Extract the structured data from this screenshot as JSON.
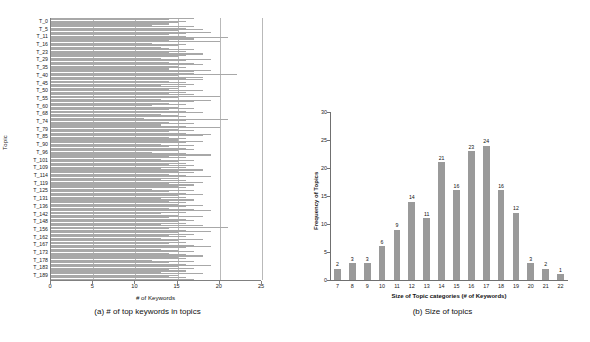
{
  "figure": {
    "panels": [
      {
        "id": "a",
        "caption": "(a) # of top keywords in topics",
        "xlabel": "# of Keywords",
        "ylabel": "Topic"
      },
      {
        "id": "b",
        "caption": "(b) Size of topics",
        "xlabel": "Size of Topic categories (# of Keywords)",
        "ylabel": "Frequency of Topics"
      }
    ],
    "colors": {
      "bar_a": "#a8a8a8",
      "bar_b": "#9a9a9a",
      "grid": "#b9b9b9",
      "axis": "#707070",
      "background": "#ffffff"
    }
  },
  "chart_data": [
    {
      "type": "bar",
      "orientation": "horizontal",
      "title": "(a) # of top keywords in topics",
      "xlabel": "# of Keywords",
      "ylabel": "Topic",
      "xlim": [
        0,
        25
      ],
      "xticks": [
        0,
        5,
        10,
        15,
        20,
        25
      ],
      "ytick_labels": [
        "T_0",
        "T_5",
        "T_11",
        "T_16",
        "T_23",
        "T_29",
        "T_35",
        "T_40",
        "T_45",
        "T_50",
        "T_55",
        "T_60",
        "T_68",
        "T_74",
        "T_79",
        "T_85",
        "T_90",
        "T_96",
        "T_101",
        "T_109",
        "T_114",
        "T_119",
        "T_125",
        "T_131",
        "T_136",
        "T_142",
        "T_148",
        "T_156",
        "T_162",
        "T_167",
        "T_173",
        "T_178",
        "T_183",
        "T_189"
      ],
      "grid": true,
      "legend": "none",
      "categories": [
        "T_0",
        "T_1",
        "T_2",
        "T_3",
        "T_4",
        "T_5",
        "T_6",
        "T_7",
        "T_8",
        "T_9",
        "T_10",
        "T_11",
        "T_12",
        "T_13",
        "T_14",
        "T_15",
        "T_16",
        "T_17",
        "T_18",
        "T_19",
        "T_20",
        "T_21",
        "T_22",
        "T_23",
        "T_24",
        "T_25",
        "T_26",
        "T_27",
        "T_28",
        "T_29",
        "T_30",
        "T_31",
        "T_32",
        "T_33",
        "T_34",
        "T_35",
        "T_36",
        "T_37",
        "T_38",
        "T_39",
        "T_40",
        "T_41",
        "T_42",
        "T_43",
        "T_44",
        "T_45",
        "T_46",
        "T_47",
        "T_48",
        "T_49",
        "T_50",
        "T_51",
        "T_52",
        "T_53",
        "T_54",
        "T_55",
        "T_56",
        "T_57",
        "T_58",
        "T_59",
        "T_60",
        "T_61",
        "T_62",
        "T_63",
        "T_64",
        "T_65",
        "T_66",
        "T_67",
        "T_68",
        "T_69",
        "T_70",
        "T_71",
        "T_72",
        "T_73",
        "T_74",
        "T_75",
        "T_76",
        "T_77",
        "T_78",
        "T_79",
        "T_80",
        "T_81",
        "T_82",
        "T_83",
        "T_84",
        "T_85",
        "T_86",
        "T_87",
        "T_88",
        "T_89",
        "T_90",
        "T_91",
        "T_92",
        "T_93",
        "T_94",
        "T_95",
        "T_96",
        "T_97",
        "T_98",
        "T_99",
        "T_100",
        "T_101",
        "T_102",
        "T_103",
        "T_104",
        "T_105",
        "T_106",
        "T_107",
        "T_108",
        "T_109",
        "T_110",
        "T_111",
        "T_112",
        "T_113",
        "T_114",
        "T_115",
        "T_116",
        "T_117",
        "T_118",
        "T_119",
        "T_120",
        "T_121",
        "T_122",
        "T_123",
        "T_124",
        "T_125",
        "T_126",
        "T_127",
        "T_128",
        "T_129",
        "T_130",
        "T_131",
        "T_132",
        "T_133",
        "T_134",
        "T_135",
        "T_136",
        "T_137",
        "T_138",
        "T_139",
        "T_140",
        "T_141",
        "T_142",
        "T_143",
        "T_144",
        "T_145",
        "T_146",
        "T_147",
        "T_148",
        "T_149",
        "T_150",
        "T_151",
        "T_152",
        "T_153",
        "T_154",
        "T_155",
        "T_156",
        "T_157",
        "T_158",
        "T_159",
        "T_160",
        "T_161",
        "T_162",
        "T_163",
        "T_164",
        "T_165",
        "T_166",
        "T_167",
        "T_168",
        "T_169",
        "T_170",
        "T_171",
        "T_172",
        "T_173",
        "T_174",
        "T_175",
        "T_176",
        "T_177",
        "T_178",
        "T_179",
        "T_180",
        "T_181",
        "T_182",
        "T_183",
        "T_184",
        "T_185",
        "T_186",
        "T_187",
        "T_188",
        "T_189"
      ],
      "values": [
        17,
        14,
        16,
        15,
        14,
        12,
        17,
        16,
        18,
        15,
        19,
        16,
        14,
        16,
        21,
        17,
        14,
        20,
        12,
        16,
        15,
        13,
        14,
        17,
        16,
        14,
        18,
        16,
        15,
        13,
        19,
        16,
        14,
        17,
        18,
        15,
        16,
        14,
        19,
        17,
        17,
        22,
        15,
        18,
        16,
        18,
        14,
        16,
        17,
        13,
        16,
        15,
        14,
        18,
        16,
        14,
        17,
        20,
        15,
        13,
        19,
        17,
        14,
        16,
        12,
        15,
        17,
        14,
        16,
        18,
        13,
        15,
        16,
        11,
        21,
        16,
        14,
        17,
        13,
        16,
        20,
        15,
        17,
        14,
        16,
        19,
        18,
        14,
        16,
        15,
        18,
        16,
        13,
        17,
        14,
        16,
        17,
        15,
        12,
        16,
        19,
        14,
        16,
        13,
        17,
        15,
        16,
        14,
        17,
        16,
        13,
        18,
        15,
        17,
        14,
        16,
        19,
        15,
        13,
        16,
        18,
        14,
        17,
        15,
        16,
        12,
        17,
        14,
        16,
        18,
        15,
        16,
        13,
        17,
        14,
        16,
        15,
        18,
        16,
        14,
        17,
        19,
        16,
        13,
        15,
        18,
        14,
        16,
        17,
        15,
        16,
        13,
        18,
        21,
        14,
        16,
        19,
        15,
        17,
        14,
        16,
        13,
        18,
        15,
        16,
        14,
        17,
        19,
        16,
        13,
        15,
        17,
        14,
        16,
        18,
        15,
        16,
        12,
        17,
        14,
        16,
        19,
        15,
        17,
        14,
        16,
        13,
        18,
        15,
        14,
        16,
        17
      ]
    },
    {
      "type": "bar",
      "orientation": "vertical",
      "title": "(b) Size of topics",
      "xlabel": "Size of Topic categories (# of Keywords)",
      "ylabel": "Frequency of Topics",
      "ylim": [
        0,
        30
      ],
      "yticks": [
        0,
        5,
        10,
        15,
        20,
        25,
        30
      ],
      "grid": false,
      "legend": "none",
      "data_labels": true,
      "categories": [
        "7",
        "8",
        "9",
        "10",
        "11",
        "12",
        "13",
        "14",
        "15",
        "16",
        "17",
        "18",
        "19",
        "20",
        "21",
        "22"
      ],
      "values": [
        2,
        3,
        3,
        6,
        9,
        14,
        11,
        21,
        16,
        23,
        24,
        16,
        12,
        3,
        2,
        1
      ]
    }
  ]
}
